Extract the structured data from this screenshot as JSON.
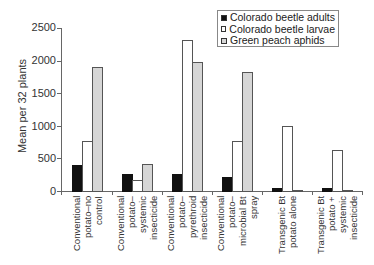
{
  "chart_data": {
    "type": "bar",
    "title": "",
    "xlabel": "",
    "ylabel": "Mean per 32 plants",
    "ylim": [
      0,
      2500
    ],
    "yticks": [
      0,
      500,
      1000,
      1500,
      2000,
      2500
    ],
    "grid": false,
    "legend_position": "top-right",
    "categories": [
      "Conventional potato–no control",
      "Conventional potato–systemic insecticide",
      "Conventional potato–pyrethroid insecticide",
      "Conventional potato–microbial Bt spray",
      "Transgenic Bt potato alone",
      "Transgenic Bt potato + systemic insecticide"
    ],
    "category_lines": [
      "Conventional\npotato–no\ncontrol",
      "Conventional\npotato–\nsystemic\ninsecticide",
      "Conventional\npotato–\npyrethroid\ninsecticide",
      "Conventional\npotato–\nmicrobial Bt\nspray",
      "Transgenic Bt\npotato alone",
      "Transgenic Bt\npotato +\nsystemic\ninsecticide"
    ],
    "series": [
      {
        "name": "Colorado beetle adults",
        "color": "#111111",
        "values": [
          400,
          260,
          260,
          215,
          40,
          40
        ]
      },
      {
        "name": "Colorado beetle larvae",
        "color": "#ffffff",
        "values": [
          760,
          170,
          2320,
          760,
          990,
          630
        ]
      },
      {
        "name": "Green peach aphids",
        "color": "#d6d6d6",
        "values": [
          1900,
          410,
          1980,
          1820,
          5,
          5
        ]
      }
    ]
  }
}
